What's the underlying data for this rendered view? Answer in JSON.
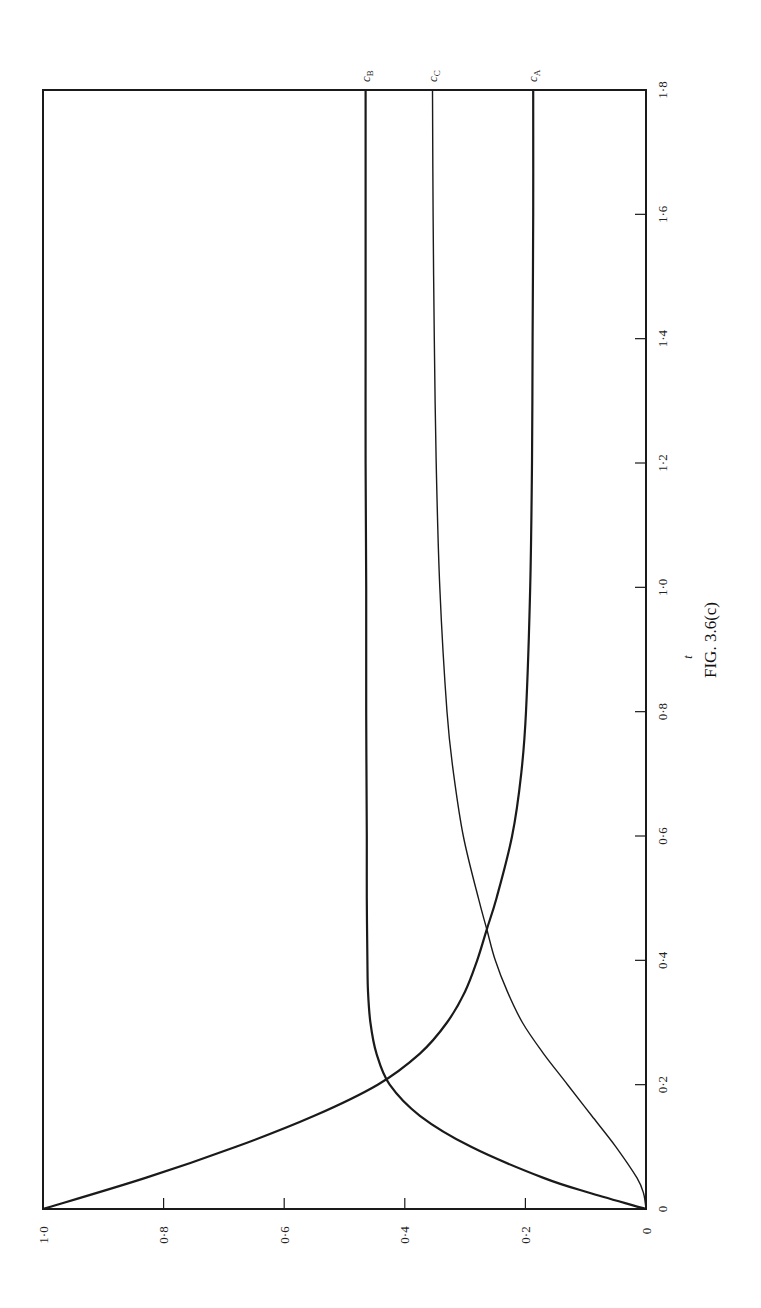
{
  "figure": {
    "caption": "FIG. 3.6(c)",
    "rotation_deg": -90
  },
  "chart_data": {
    "type": "line",
    "title": "",
    "caption": "FIG. 3.6(c)",
    "xlabel": "t",
    "ylabel": "",
    "xlim": [
      0,
      1.8
    ],
    "ylim": [
      0,
      1.0
    ],
    "x_ticks": [
      "0",
      "0·2",
      "0·4",
      "0·6",
      "0·8",
      "1·0",
      "1·2",
      "1·4",
      "1·6",
      "1·8"
    ],
    "y_ticks": [
      "0",
      "0·2",
      "0·4",
      "0·6",
      "0·8",
      "1·0"
    ],
    "x_tick_values": [
      0,
      0.2,
      0.4,
      0.6,
      0.8,
      1.0,
      1.2,
      1.4,
      1.6,
      1.8
    ],
    "y_tick_values": [
      0,
      0.2,
      0.4,
      0.6,
      0.8,
      1.0
    ],
    "grid": false,
    "legend": "inline labels at right end of curves",
    "orientation": "rotated 90° counter-clockwise on page (t axis vertical on right, c axis horizontal along bottom)",
    "series": [
      {
        "name": "c_A",
        "label_main": "c",
        "label_sub": "A",
        "line_width": 2.2,
        "x": [
          0,
          0.05,
          0.1,
          0.15,
          0.2,
          0.25,
          0.3,
          0.35,
          0.4,
          0.45,
          0.5,
          0.6,
          0.7,
          0.8,
          1.0,
          1.2,
          1.4,
          1.6,
          1.8
        ],
        "values": [
          1.0,
          0.83,
          0.68,
          0.55,
          0.445,
          0.375,
          0.33,
          0.3,
          0.28,
          0.264,
          0.248,
          0.222,
          0.207,
          0.199,
          0.192,
          0.189,
          0.188,
          0.187,
          0.187
        ]
      },
      {
        "name": "c_B",
        "label_main": "c",
        "label_sub": "B",
        "line_width": 2.2,
        "x": [
          0,
          0.025,
          0.05,
          0.1,
          0.15,
          0.2,
          0.25,
          0.3,
          0.35,
          0.4,
          0.5,
          0.6,
          0.8,
          1.0,
          1.2,
          1.4,
          1.6,
          1.8
        ],
        "values": [
          0,
          0.09,
          0.17,
          0.29,
          0.375,
          0.425,
          0.447,
          0.457,
          0.461,
          0.462,
          0.463,
          0.463,
          0.464,
          0.464,
          0.465,
          0.465,
          0.465,
          0.465
        ]
      },
      {
        "name": "c_C",
        "label_main": "c",
        "label_sub": "C",
        "line_width": 1.4,
        "x": [
          0,
          0.025,
          0.05,
          0.1,
          0.15,
          0.2,
          0.25,
          0.3,
          0.35,
          0.4,
          0.45,
          0.5,
          0.6,
          0.7,
          0.8,
          1.0,
          1.2,
          1.4,
          1.6,
          1.8
        ],
        "values": [
          0,
          0.004,
          0.015,
          0.05,
          0.09,
          0.13,
          0.17,
          0.205,
          0.23,
          0.25,
          0.264,
          0.278,
          0.303,
          0.319,
          0.33,
          0.342,
          0.348,
          0.351,
          0.353,
          0.354
        ]
      }
    ]
  },
  "colors": {
    "ink": "#1a1a1a",
    "background": "#ffffff"
  }
}
